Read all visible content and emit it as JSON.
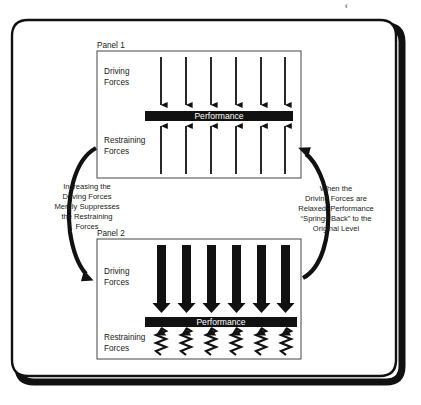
{
  "figure": {
    "outer_frame": {
      "shape": "rounded-rectangle-with-drop-shadow",
      "stroke_color": "#111111",
      "fill_color": "#ffffff"
    },
    "panels": [
      {
        "id": "panel-1",
        "label": "Panel 1",
        "driving_forces_label": "Driving\nForces",
        "driving_forces_line1": "Driving",
        "driving_forces_line2": "Forces",
        "restraining_forces_line1": "Restraining",
        "restraining_forces_line2": "Forces",
        "performance_bar_label": "Performance",
        "driving_arrow_count": 6,
        "driving_arrow_style": "thin",
        "restraining_arrow_count": 6,
        "restraining_arrow_style": "thin-line-arrow"
      },
      {
        "id": "panel-2",
        "label": "Panel 2",
        "driving_forces_line1": "Driving",
        "driving_forces_line2": "Forces",
        "restraining_forces_line1": "Restraining",
        "restraining_forces_line2": "Forces",
        "performance_bar_label": "Performance",
        "driving_arrow_count": 6,
        "driving_arrow_style": "thick-block",
        "restraining_arrow_count": 6,
        "restraining_arrow_style": "compressed-spring-zigzag"
      }
    ],
    "captions": {
      "left": {
        "name": "increasing-driving-forces-caption",
        "lines": [
          "Increasing the",
          "Driving Forces",
          "Merely Suppresses",
          "the Restraining",
          "Forces"
        ]
      },
      "right": {
        "name": "springs-back-caption",
        "lines": [
          "When the",
          "Driving Forces are",
          "Relaxed, Performance",
          "“Springs Back” to the",
          "Original Level"
        ]
      }
    },
    "cycle_arrows": [
      {
        "name": "left-cycle-arrow",
        "direction": "panel-1-to-panel-2",
        "shape": "curved-down-left"
      },
      {
        "name": "right-cycle-arrow",
        "direction": "panel-2-to-panel-1",
        "shape": "curved-up-right"
      }
    ],
    "colors": {
      "ink": "#111111",
      "bar_fill": "#111111",
      "bar_text": "#ffffff",
      "panel_border": "#333333",
      "page_background": "#ffffff"
    }
  }
}
